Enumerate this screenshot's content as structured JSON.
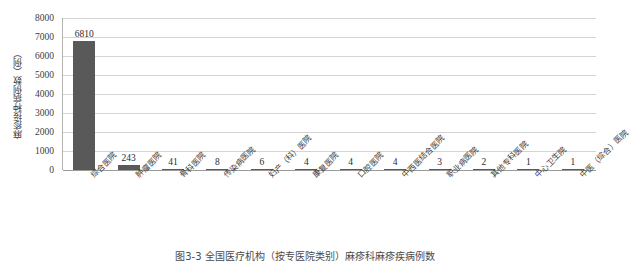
{
  "figure": {
    "caption": "图3-3  全国医疗机构（按专医院类别）麻疹科麻疹疾病例数",
    "bar_color": "#595959",
    "grid_color": "#d4d4d4",
    "axis_color": "#9b9b9b"
  },
  "chart_data": {
    "type": "bar",
    "title": "",
    "subtitle": "",
    "xlabel": "",
    "ylabel": "麻疹接种病例数（例）",
    "ylim": [
      0,
      8000
    ],
    "yticks": [
      8000,
      7000,
      6000,
      5000,
      4000,
      3000,
      2000,
      1000,
      0
    ],
    "grid": true,
    "legend": null,
    "categories": [
      "综合医院",
      "肿瘤医院",
      "骨科医院",
      "传染病医院",
      "妇产（科）医院",
      "康复医院",
      "口腔医院",
      "中西医结合医院",
      "职业病医院",
      "其他专科医院",
      "中心卫生院",
      "中医（综合）医院"
    ],
    "values": [
      6810,
      243,
      41,
      8,
      6,
      4,
      4,
      4,
      3,
      2,
      1,
      1
    ],
    "data_labels": [
      "6810",
      "243",
      "41",
      "8",
      "6",
      "4",
      "4",
      "4",
      "3",
      "2",
      "1",
      "1"
    ]
  }
}
